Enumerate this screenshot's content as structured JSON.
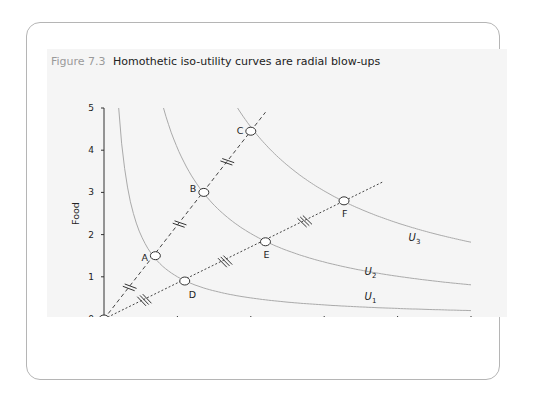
{
  "icon": {
    "name": "double-chevron-right-icon",
    "glyph": "»"
  },
  "figure": {
    "number": "Figure 7.3",
    "title": "Homothetic iso-utility curves are radial blow-ups"
  },
  "chart_data": {
    "type": "line",
    "title": "Homothetic iso-utility curves are radial blow-ups",
    "xlabel": "Manufactures",
    "ylabel": "Food",
    "xlim": [
      0,
      5
    ],
    "ylim": [
      0,
      5
    ],
    "x_ticks": [
      "0",
      "1",
      "2",
      "3",
      "4",
      "5"
    ],
    "y_ticks": [
      "0",
      "1",
      "2",
      "3",
      "4",
      "5"
    ],
    "grid": false,
    "series": [
      {
        "name": "U1",
        "kind": "iso-utility curve",
        "constant_xy": 1.0
      },
      {
        "name": "U2",
        "kind": "iso-utility curve",
        "constant_xy": 4.05
      },
      {
        "name": "U3",
        "kind": "iso-utility curve",
        "constant_xy": 9.1
      },
      {
        "name": "Ray OC",
        "kind": "dashed ray",
        "x": [
          0,
          2.2
        ],
        "y": [
          0,
          4.9
        ]
      },
      {
        "name": "Ray OF",
        "kind": "dotted ray",
        "x": [
          0,
          3.8
        ],
        "y": [
          0,
          3.25
        ]
      }
    ],
    "points": [
      {
        "label": "A",
        "x": 0.7,
        "y": 1.5
      },
      {
        "label": "B",
        "x": 1.36,
        "y": 3.0
      },
      {
        "label": "C",
        "x": 2.0,
        "y": 4.45
      },
      {
        "label": "D",
        "x": 1.1,
        "y": 0.9
      },
      {
        "label": "E",
        "x": 2.2,
        "y": 1.83
      },
      {
        "label": "F",
        "x": 3.27,
        "y": 2.8
      },
      {
        "label": "",
        "x": 0,
        "y": 0
      }
    ],
    "curve_labels": [
      {
        "text": "U",
        "sub": "1",
        "x": 3.55,
        "y": 0.45
      },
      {
        "text": "U",
        "sub": "2",
        "x": 3.55,
        "y": 1.05
      },
      {
        "text": "U",
        "sub": "3",
        "x": 4.15,
        "y": 1.85
      }
    ],
    "annotations": "Equal tick-marks (||) on segments OA, AB, BC and (|||) on OD, DE, EF indicate equal distances along each ray"
  }
}
